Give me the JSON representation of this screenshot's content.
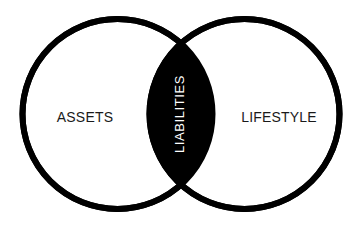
{
  "diagram": {
    "type": "venn-diagram",
    "set_count": 2,
    "background_color": "#ffffff",
    "stroke_color": "#000000",
    "stroke_width": 6,
    "fill_color": "#ffffff",
    "overlap_fill_color": "#000000",
    "overlap_text_color": "#ffffff",
    "outer_text_color": "#1a1a1a",
    "left_circle": {
      "label": "ASSETS",
      "cx": 117.5,
      "cy": 114,
      "r": 95,
      "label_x": 85,
      "label_y": 118
    },
    "right_circle": {
      "label": "LIFESTYLE",
      "cx": 244.5,
      "cy": 114,
      "r": 95,
      "label_x": 279,
      "label_y": 118
    },
    "overlap": {
      "label": "LIABILITIES",
      "center_x": 181,
      "center_y": 114,
      "top_vertex_y": 33,
      "bottom_vertex_y": 196,
      "rotation_degrees": -90
    }
  }
}
